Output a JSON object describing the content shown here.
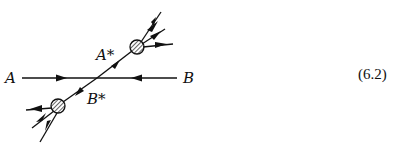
{
  "diagram": {
    "type": "Feynman-like scattering diagram",
    "labels": {
      "a": "A",
      "b": "B",
      "a_star": "A*",
      "b_star": "B*"
    },
    "equation_number": "(6.2)",
    "colors": {
      "ink": "#111111",
      "background": "#ffffff"
    },
    "elements": [
      {
        "name": "incoming-line-A",
        "from": "A",
        "to": "vertex",
        "arrow": "right"
      },
      {
        "name": "incoming-line-B",
        "from": "B",
        "to": "vertex",
        "arrow": "left"
      },
      {
        "name": "outgoing-line-A-star",
        "from": "vertex",
        "to": "upper-blob",
        "arrow": "up-right"
      },
      {
        "name": "outgoing-line-B-star",
        "from": "vertex",
        "to": "lower-blob",
        "arrow": "down-left"
      },
      {
        "name": "upper-blob",
        "style": "hatched circle",
        "decay_products": 3
      },
      {
        "name": "lower-blob",
        "style": "hatched circle",
        "decay_products": 3
      }
    ]
  }
}
